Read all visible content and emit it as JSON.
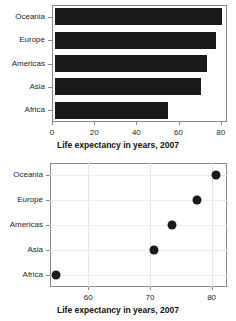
{
  "chart_data": [
    {
      "type": "bar",
      "orientation": "horizontal",
      "title": "",
      "categories": [
        "Oceania",
        "Europe",
        "Americas",
        "Asia",
        "Africa"
      ],
      "values": [
        80.7,
        77.6,
        73.6,
        70.7,
        54.8
      ],
      "xlabel": "Life expectancy in years, 2007",
      "ylabel": "",
      "xlim": [
        0,
        83
      ],
      "xticks": [
        0,
        20,
        40,
        60,
        80
      ],
      "xtick_labels": [
        "0",
        "20",
        "40",
        "60",
        "80"
      ],
      "grid": false,
      "bar_color": "#1a1a1a",
      "legend": "none"
    },
    {
      "type": "scatter",
      "title": "",
      "categories": [
        "Oceania",
        "Europe",
        "Americas",
        "Asia",
        "Africa"
      ],
      "values": [
        80.7,
        77.6,
        73.6,
        70.7,
        54.8
      ],
      "xlabel": "Life expectancy in years, 2007",
      "ylabel": "",
      "xlim": [
        53.8,
        82.5
      ],
      "xticks": [
        60,
        70,
        80
      ],
      "xtick_labels": [
        "60",
        "70",
        "80"
      ],
      "grid": true,
      "marker_color": "#1a1a1a",
      "legend": "none"
    }
  ],
  "colors": {
    "ink": "#1a1a1a",
    "frame": "#8a8a8a",
    "grid": "#e6e6e6",
    "background": "#ffffff"
  }
}
